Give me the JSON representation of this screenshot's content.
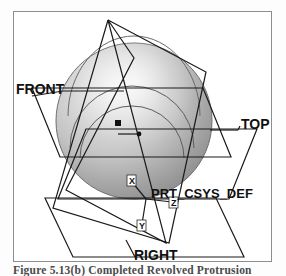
{
  "figure": {
    "caption": "Figure 5.13(b) Completed Revolved Protrusion",
    "background_color": "#ffffff",
    "frame_color": "#8d8d8d",
    "line_color": "#1a1a1a",
    "label_color": "#101010"
  },
  "model": {
    "solid": {
      "name": "sphere",
      "shape": "revolved protrusion sphere",
      "fill_light": "#efefef",
      "fill_mid": "#bdbdbd",
      "fill_dark": "#8a8a8a",
      "outline": "#6e6e6e",
      "center_x": 133,
      "center_y": 120,
      "radius": 78
    },
    "datum_point": {
      "name": "datum-point-marker",
      "x": 116,
      "y": 122,
      "size": 5
    },
    "leader_dot": {
      "name": "leader-endpoint-dot",
      "x": 137,
      "y": 133,
      "size": 3
    }
  },
  "datum_planes": [
    {
      "id": "front",
      "label": "FRONT",
      "label_x": 16,
      "label_y": 88,
      "leader_from_x": 62,
      "leader_from_y": 84,
      "leader_to_x": 105,
      "leader_to_y": 88
    },
    {
      "id": "top",
      "label": "TOP",
      "label_x": 240,
      "label_y": 124,
      "leader_from_x": 208,
      "leader_from_y": 128,
      "leader_to_x": 238,
      "leader_to_y": 122
    },
    {
      "id": "right",
      "label": "RIGHT",
      "label_x": 128,
      "label_y": 258,
      "leader_from_x": 126,
      "leader_from_y": 243,
      "leader_to_x": 132,
      "leader_to_y": 253
    }
  ],
  "coordinate_system": {
    "name": "PRT_CSYS_DEF",
    "label": "PRT_CSYS_DEF",
    "label_x": 152,
    "label_y": 193,
    "origin_x": 145,
    "origin_y": 196,
    "axes": [
      {
        "name": "x-axis",
        "label": "X",
        "tag_x": 136,
        "tag_y": 183
      },
      {
        "name": "y-axis",
        "label": "Y",
        "tag_x": 140,
        "tag_y": 212
      },
      {
        "name": "z-axis",
        "label": "Z",
        "tag_x": 160,
        "tag_y": 196
      }
    ],
    "axis_tag_labels": [
      "X",
      "Y",
      "Z"
    ]
  },
  "annotations": {
    "plane_labels": [
      "FRONT",
      "TOP",
      "RIGHT"
    ],
    "csys_label": "PRT_CSYS_DEF"
  }
}
